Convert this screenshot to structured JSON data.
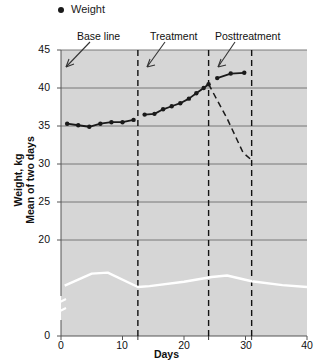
{
  "legend": {
    "entries": [
      {
        "label": "Weight",
        "marker": "filled-circle",
        "color": "#1a1a1a"
      }
    ]
  },
  "annotations": {
    "baseline": "Base line",
    "treatment": "Treatment",
    "posttreatment": "Posttreatment"
  },
  "axes": {
    "y_title_line1": "Weight, kg",
    "y_title_line2": "Mean of two days",
    "x_title": "Days",
    "y_ticks": [
      "45",
      "40",
      "35",
      "30",
      "25",
      "20",
      "0"
    ],
    "x_ticks": [
      "0",
      "10",
      "20",
      "30",
      "40"
    ]
  },
  "colors": {
    "plot_background": "#d6d6d6",
    "gridline": "#6e6e6e",
    "series_weight": "#1a1a1a",
    "series_secondary": "#ffffff",
    "divider": "#111111",
    "text": "#111111"
  },
  "chart_data": {
    "type": "line",
    "title": "",
    "xlabel": "Days",
    "ylabel": "Weight, kg / Mean of two days",
    "xlim": [
      0,
      40
    ],
    "ylim": [
      0,
      45
    ],
    "y_axis_break": {
      "between": [
        0,
        20
      ],
      "note": "axis broken between 0 and 20"
    },
    "grid": "horizontal",
    "legend_position": "top-left",
    "phase_dividers": [
      {
        "label": "Base line end",
        "x": 12.5
      },
      {
        "label": "Treatment end",
        "x": 24
      },
      {
        "label": "Posttreatment end",
        "x": 31
      }
    ],
    "series": [
      {
        "name": "Weight",
        "style": "solid-with-markers",
        "color": "#1a1a1a",
        "phase": "Base line",
        "points": [
          {
            "x": 1.0,
            "y": 35.3
          },
          {
            "x": 2.8,
            "y": 35.1
          },
          {
            "x": 4.6,
            "y": 34.9
          },
          {
            "x": 6.4,
            "y": 35.3
          },
          {
            "x": 8.2,
            "y": 35.5
          },
          {
            "x": 10.0,
            "y": 35.5
          },
          {
            "x": 11.8,
            "y": 35.8
          }
        ]
      },
      {
        "name": "Weight",
        "style": "solid-with-markers",
        "color": "#1a1a1a",
        "phase": "Treatment",
        "points": [
          {
            "x": 13.6,
            "y": 36.5
          },
          {
            "x": 15.2,
            "y": 36.6
          },
          {
            "x": 16.6,
            "y": 37.2
          },
          {
            "x": 18.0,
            "y": 37.6
          },
          {
            "x": 19.4,
            "y": 38.0
          },
          {
            "x": 20.8,
            "y": 38.6
          },
          {
            "x": 22.0,
            "y": 39.3
          },
          {
            "x": 23.2,
            "y": 40.0
          },
          {
            "x": 24.0,
            "y": 40.5
          }
        ]
      },
      {
        "name": "Weight",
        "style": "solid-with-markers",
        "color": "#1a1a1a",
        "phase": "Posttreatment",
        "points": [
          {
            "x": 25.4,
            "y": 41.3
          },
          {
            "x": 27.6,
            "y": 41.9
          },
          {
            "x": 29.8,
            "y": 42.0
          }
        ]
      },
      {
        "name": "Projected decline",
        "style": "dashed",
        "color": "#1a1a1a",
        "phase": "Posttreatment projection",
        "points": [
          {
            "x": 24.0,
            "y": 40.5
          },
          {
            "x": 27.0,
            "y": 36.0
          },
          {
            "x": 29.6,
            "y": 31.5
          },
          {
            "x": 31.0,
            "y": 30.5
          }
        ]
      },
      {
        "name": "Secondary measure",
        "style": "solid",
        "color": "#ffffff",
        "phase": "all",
        "points": [
          {
            "x": 0.6,
            "y": 10.5
          },
          {
            "x": 5.0,
            "y": 13.0
          },
          {
            "x": 7.6,
            "y": 13.2
          },
          {
            "x": 12.5,
            "y": 10.2
          },
          {
            "x": 14.4,
            "y": 10.4
          },
          {
            "x": 20.0,
            "y": 11.3
          },
          {
            "x": 24.5,
            "y": 12.3
          },
          {
            "x": 27.0,
            "y": 12.6
          },
          {
            "x": 31.0,
            "y": 11.4
          },
          {
            "x": 36.0,
            "y": 10.6
          },
          {
            "x": 40.0,
            "y": 10.2
          }
        ]
      }
    ]
  }
}
